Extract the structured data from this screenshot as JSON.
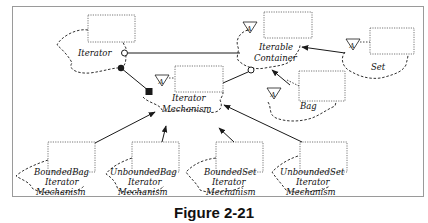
{
  "figure": {
    "caption": "Figure 2-21",
    "type": "Booch class diagram"
  },
  "classes": [
    {
      "id": "iterator",
      "name": "Iterator",
      "abstract": false
    },
    {
      "id": "iterable-container",
      "name": "Iterable Container",
      "line1": "Iterable",
      "line2": "Container",
      "abstract": true
    },
    {
      "id": "set",
      "name": "Set",
      "abstract": true
    },
    {
      "id": "bag",
      "name": "Bag",
      "abstract": true
    },
    {
      "id": "iterator-mechanism",
      "name": "Iterator Mechanism",
      "line1": "Iterator",
      "line2": "Mechanism",
      "abstract": true
    },
    {
      "id": "bounded-bag-iterator-mechanism",
      "line1": "BoundedBag",
      "line2": "Iterator",
      "line3": "Mechanism"
    },
    {
      "id": "unbounded-bag-iterator-mechanism",
      "line1": "UnboundedBag",
      "line2": "Iterator",
      "line3": "Mechanism"
    },
    {
      "id": "bounded-set-iterator-mechanism",
      "line1": "BoundedSet",
      "line2": "Iterator",
      "line3": "Mechanism"
    },
    {
      "id": "unbounded-set-iterator-mechanism",
      "line1": "UnboundedSet",
      "line2": "Iterator",
      "line3": "Mechanism"
    }
  ],
  "adornments": {
    "abstract_marker": "A"
  },
  "relationships": [
    {
      "from": "Iterator",
      "to": "Iterable Container",
      "type": "association"
    },
    {
      "from": "Iterator",
      "to": "Iterator Mechanism",
      "type": "has (aggregation)"
    },
    {
      "from": "Iterator Mechanism",
      "to": "Iterable Container",
      "type": "association"
    },
    {
      "from": "Set",
      "to": "Iterable Container",
      "type": "inheritance"
    },
    {
      "from": "Bag",
      "to": "Iterable Container",
      "type": "inheritance"
    },
    {
      "from": "BoundedBag Iterator Mechanism",
      "to": "Iterator Mechanism",
      "type": "inheritance"
    },
    {
      "from": "UnboundedBag Iterator Mechanism",
      "to": "Iterator Mechanism",
      "type": "inheritance"
    },
    {
      "from": "BoundedSet Iterator Mechanism",
      "to": "Iterator Mechanism",
      "type": "inheritance"
    },
    {
      "from": "UnboundedSet Iterator Mechanism",
      "to": "Iterator Mechanism",
      "type": "inheritance"
    }
  ],
  "colors": {
    "line": "#1a1a1a",
    "frame": "#9a9a9a",
    "background": "#ffffff"
  }
}
